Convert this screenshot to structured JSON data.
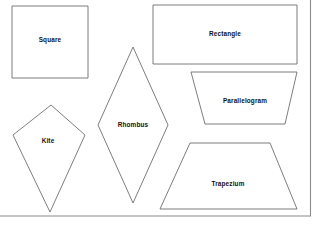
{
  "page": {
    "background_color": "#ffffff",
    "stroke_color": "#6e6e6e",
    "frame_color": "#8a8a8a",
    "label_color": "#111111",
    "width": 319,
    "height": 226
  },
  "frame": {
    "bottom_rule": {
      "x1": 0,
      "y1": 216,
      "x2": 311,
      "y2": 216
    },
    "right_rule": {
      "x1": 310.5,
      "y1": 0,
      "x2": 310.5,
      "y2": 216
    }
  },
  "shapes": [
    {
      "name": "square",
      "label": "Square",
      "points": "12,6 88,6 88,78 12,78",
      "label_x": 50,
      "label_y": 39
    },
    {
      "name": "rectangle",
      "label": "Rectangle",
      "points": "153,5 297,5 297,64 153,64",
      "label_x": 225,
      "label_y": 33
    },
    {
      "name": "parallelogram",
      "label": "Parallelogram",
      "points": "191,72 297,72 285,124 205,124",
      "label_x": 245,
      "label_y": 100
    },
    {
      "name": "rhombus",
      "label": "Rhombus",
      "points": "133,47 168,125 133,203 98,125",
      "label_x": 133,
      "label_y": 124
    },
    {
      "name": "kite",
      "label": "Kite",
      "points": "51,105 85,135 50,212 13,135",
      "label_x": 48,
      "label_y": 140
    },
    {
      "name": "trapezium",
      "label": "Trapezium",
      "points": "190,143 270,143 297,209 160,209",
      "label_x": 228,
      "label_y": 183
    }
  ]
}
